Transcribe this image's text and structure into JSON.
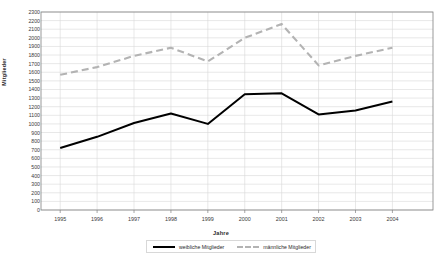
{
  "chart_data": {
    "type": "line",
    "title": "",
    "xlabel": "Jahre",
    "ylabel": "Mitglieder",
    "categories": [
      "1995",
      "1996",
      "1997",
      "1998",
      "1999",
      "2000",
      "2001",
      "2002",
      "2003",
      "2004"
    ],
    "x": [
      1995,
      1996,
      1997,
      1998,
      1999,
      2000,
      2001,
      2002,
      2003,
      2004
    ],
    "ylim": [
      0,
      2300
    ],
    "ytick_step": 100,
    "yticks": [
      0,
      100,
      200,
      300,
      400,
      500,
      600,
      700,
      800,
      900,
      1000,
      1100,
      1200,
      1300,
      1400,
      1500,
      1600,
      1700,
      1800,
      1900,
      2000,
      2100,
      2200,
      2300
    ],
    "grid": "horizontal-and-vertical",
    "legend_position": "bottom-center",
    "series": [
      {
        "name": "weibliche Mitglieder",
        "color": "#000000",
        "style": "solid",
        "values": [
          720,
          850,
          1010,
          1120,
          1000,
          1345,
          1355,
          1110,
          1155,
          1260
        ]
      },
      {
        "name": "männliche Mitglieder",
        "color": "#b3b3b3",
        "style": "dashed",
        "values": [
          1570,
          1660,
          1790,
          1885,
          1725,
          2000,
          2160,
          1680,
          1790,
          1885
        ]
      }
    ]
  },
  "legend": {
    "items": [
      {
        "label": "weibliche Mitglieder"
      },
      {
        "label": "männliche Mitglieder"
      }
    ]
  },
  "axes": {
    "y_title": "Mitglieder",
    "x_title": "Jahre"
  },
  "colors": {
    "series_female": "#000000",
    "series_male": "#b3b3b3",
    "grid": "#d9d9d9",
    "frame": "#808080",
    "background": "#ffffff"
  }
}
